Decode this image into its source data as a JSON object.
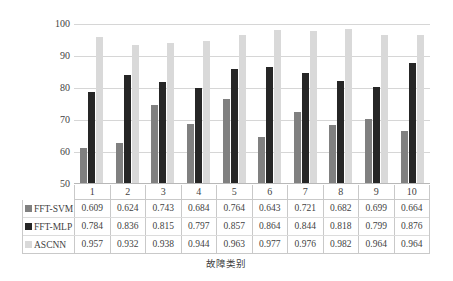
{
  "chart_data": {
    "type": "bar",
    "title": "",
    "xlabel": "故障类别",
    "ylabel": "故障识别准确率/%",
    "ylim": [
      50,
      100
    ],
    "yticks": [
      50,
      60,
      70,
      80,
      90,
      100
    ],
    "ytick_labels": [
      "50",
      "60",
      "70",
      "80",
      "90",
      "100"
    ],
    "grid": true,
    "legend_position": "data-table",
    "categories": [
      "1",
      "2",
      "3",
      "4",
      "5",
      "6",
      "7",
      "8",
      "9",
      "10"
    ],
    "series": [
      {
        "name": "FFT-SVM",
        "color": "#808080",
        "values": [
          0.609,
          0.624,
          0.743,
          0.684,
          0.764,
          0.643,
          0.721,
          0.682,
          0.699,
          0.664
        ],
        "labels": [
          "0.609",
          "0.624",
          "0.743",
          "0.684",
          "0.764",
          "0.643",
          "0.721",
          "0.682",
          "0.699",
          "0.664"
        ]
      },
      {
        "name": "FFT-MLP",
        "color": "#262626",
        "values": [
          0.784,
          0.836,
          0.815,
          0.797,
          0.857,
          0.864,
          0.844,
          0.818,
          0.799,
          0.876
        ],
        "labels": [
          "0.784",
          "0.836",
          "0.815",
          "0.797",
          "0.857",
          "0.864",
          "0.844",
          "0.818",
          "0.799",
          "0.876"
        ]
      },
      {
        "name": "ASCNN",
        "color": "#d9d9d9",
        "values": [
          0.957,
          0.932,
          0.938,
          0.944,
          0.963,
          0.977,
          0.976,
          0.982,
          0.964,
          0.964
        ],
        "labels": [
          "0.957",
          "0.932",
          "0.938",
          "0.944",
          "0.963",
          "0.977",
          "0.976",
          "0.982",
          "0.964",
          "0.964"
        ]
      }
    ]
  },
  "colors": {
    "svm": "#808080",
    "mlp": "#262626",
    "cnn": "#d9d9d9",
    "grid": "#d6d6d6",
    "table_border": "#c9c9c9",
    "text": "#3f3f3f"
  }
}
